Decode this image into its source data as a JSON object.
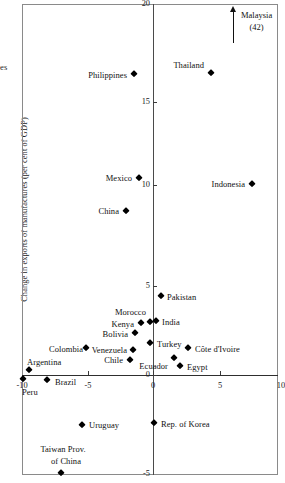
{
  "figure": {
    "ylabel": "Change in exports of manufactures (per cent of GDP)",
    "ytop_fragment": "es",
    "annotation": {
      "name": "Malaysia",
      "value": "(42)"
    }
  },
  "chart_data": {
    "type": "scatter",
    "title": "",
    "xlabel": "",
    "ylabel": "Change in exports of manufactures (per cent of GDP)",
    "xlim": [
      -10,
      10
    ],
    "ylim": [
      -5,
      20
    ],
    "xticks": [
      -10,
      -5,
      0,
      5,
      10
    ],
    "xtick_labels": [
      "-10",
      "-5",
      "0",
      "5",
      "10"
    ],
    "yticks": [
      -5,
      0,
      5,
      10,
      15,
      20
    ],
    "ytick_labels": [
      "-5",
      "0",
      "5",
      "10",
      "15",
      "20"
    ],
    "grid": false,
    "legend": "none",
    "marker": "diamond",
    "marker_color": "#000000",
    "annotations": [
      {
        "text": "Malaysia",
        "sub": "(42)",
        "x": 6.1,
        "y": 20.5,
        "note": "off-scale, arrow pointing up"
      }
    ],
    "points": [
      {
        "name": "Thailand",
        "x": 2.2,
        "y": 16.6,
        "label_pos": "left"
      },
      {
        "name": "Philippines",
        "x": -0.3,
        "y": 15.6,
        "label_pos": "left"
      },
      {
        "name": "Indonesia",
        "x": 7.4,
        "y": 10.5,
        "label_pos": "left"
      },
      {
        "name": "Mexico",
        "x": -1.1,
        "y": 10.8,
        "label_pos": "left"
      },
      {
        "name": "China",
        "x": -1.0,
        "y": 8.9,
        "label_pos": "left"
      },
      {
        "name": "Pakistan",
        "x": 0.4,
        "y": 4.6,
        "label_pos": "right"
      },
      {
        "name": "Morocco",
        "x": -0.2,
        "y": 3.1,
        "label_pos": "above-left"
      },
      {
        "name": "India",
        "x": 0.1,
        "y": 3.1,
        "label_pos": "right"
      },
      {
        "name": "Kenya",
        "x": -0.7,
        "y": 3.0,
        "label_pos": "left"
      },
      {
        "name": "Bolivia",
        "x": -1.2,
        "y": 2.4,
        "label_pos": "left"
      },
      {
        "name": "Turkey",
        "x": 0.1,
        "y": 1.9,
        "label_pos": "right"
      },
      {
        "name": "Colombia",
        "x": -3.0,
        "y": 1.4,
        "label_pos": "left"
      },
      {
        "name": "Venezuela",
        "x": -1.5,
        "y": 1.3,
        "label_pos": "left"
      },
      {
        "name": "Côte d'Ivoire",
        "x": 2.6,
        "y": 1.4,
        "label_pos": "right"
      },
      {
        "name": "Ecuador",
        "x": 1.6,
        "y": 0.8,
        "label_pos": "below-left"
      },
      {
        "name": "Chile",
        "x": -1.7,
        "y": 0.5,
        "label_pos": "left"
      },
      {
        "name": "Argentina",
        "x": -9.5,
        "y": 0.3,
        "label_pos": "above"
      },
      {
        "name": "Egypt",
        "x": 2.0,
        "y": 0.2,
        "label_pos": "right"
      },
      {
        "name": "Peru",
        "x": -9.9,
        "y": -0.2,
        "label_pos": "below"
      },
      {
        "name": "Brazil",
        "x": -8.0,
        "y": -0.3,
        "label_pos": "right"
      },
      {
        "name": "Rep. of Korea",
        "x": 0.0,
        "y": -2.6,
        "label_pos": "right"
      },
      {
        "name": "Uruguay",
        "x": -5.4,
        "y": -2.7,
        "label_pos": "right"
      },
      {
        "name": "Taiwan Prov. of China",
        "x": -7.0,
        "y": -5.4,
        "label_pos": "above"
      }
    ]
  },
  "markers": [
    {
      "name": "Thailand",
      "px": 211,
      "py": 73
    },
    {
      "name": "Philippines",
      "px": 134,
      "py": 74
    },
    {
      "name": "Indonesia",
      "px": 252,
      "py": 184
    },
    {
      "name": "Mexico",
      "px": 139,
      "py": 178
    },
    {
      "name": "China",
      "px": 126,
      "py": 211
    },
    {
      "name": "Pakistan",
      "px": 161,
      "py": 296
    },
    {
      "name": "Morocco",
      "px": 150,
      "py": 322
    },
    {
      "name": "India",
      "px": 156,
      "py": 321
    },
    {
      "name": "Kenya",
      "px": 141,
      "py": 323
    },
    {
      "name": "Bolivia",
      "px": 135,
      "py": 333
    },
    {
      "name": "Turkey",
      "px": 150,
      "py": 343
    },
    {
      "name": "Colombia",
      "px": 86,
      "py": 348
    },
    {
      "name": "Venezuela",
      "px": 133,
      "py": 350
    },
    {
      "name": "Cote d'Ivoire",
      "px": 188,
      "py": 348
    },
    {
      "name": "Ecuador",
      "px": 174,
      "py": 358
    },
    {
      "name": "Chile",
      "px": 130,
      "py": 360
    },
    {
      "name": "Argentina",
      "px": 29,
      "py": 370
    },
    {
      "name": "Egypt",
      "px": 180,
      "py": 366
    },
    {
      "name": "Peru",
      "px": 23,
      "py": 379
    },
    {
      "name": "Brazil",
      "px": 47,
      "py": 380
    },
    {
      "name": "Rep. of Korea",
      "px": 154,
      "py": 423
    },
    {
      "name": "Uruguay",
      "px": 82,
      "py": 425
    },
    {
      "name": "Taiwan Prov. of China",
      "px": 61,
      "py": 473
    }
  ],
  "labels": [
    {
      "text": "Thailand",
      "px": 204,
      "py": 65,
      "anchor": "r"
    },
    {
      "text": "Philippines",
      "px": 127,
      "py": 75,
      "anchor": "r"
    },
    {
      "text": "Indonesia",
      "px": 245,
      "py": 184,
      "anchor": "r"
    },
    {
      "text": "Mexico",
      "px": 132,
      "py": 178,
      "anchor": "r"
    },
    {
      "text": "China",
      "px": 119,
      "py": 211,
      "anchor": "r"
    },
    {
      "text": "Pakistan",
      "px": 167,
      "py": 297,
      "anchor": "l"
    },
    {
      "text": "Morocco",
      "px": 146,
      "py": 312,
      "anchor": "r"
    },
    {
      "text": "India",
      "px": 162,
      "py": 322,
      "anchor": "l"
    },
    {
      "text": "Kenya",
      "px": 134,
      "py": 324,
      "anchor": "r"
    },
    {
      "text": "Bolivia",
      "px": 128,
      "py": 334,
      "anchor": "r"
    },
    {
      "text": "Turkey",
      "px": 157,
      "py": 344,
      "anchor": "l"
    },
    {
      "text": "Colombia",
      "px": 83,
      "py": 349,
      "anchor": "r"
    },
    {
      "text": "Venezuela",
      "px": 127,
      "py": 350,
      "anchor": "r"
    },
    {
      "text": "Côte d'Ivoire",
      "px": 195,
      "py": 349,
      "anchor": "l"
    },
    {
      "text": "Ecuador",
      "px": 168,
      "py": 366,
      "anchor": "r"
    },
    {
      "text": "Chile",
      "px": 123,
      "py": 360,
      "anchor": "r"
    },
    {
      "text": "Argentina",
      "px": 27,
      "py": 362,
      "anchor": "l"
    },
    {
      "text": "Egypt",
      "px": 187,
      "py": 367,
      "anchor": "l"
    },
    {
      "text": "Peru",
      "px": 22,
      "py": 392,
      "anchor": "l"
    },
    {
      "text": "Brazil",
      "px": 55,
      "py": 382,
      "anchor": "l"
    },
    {
      "text": "Rep. of Korea",
      "px": 161,
      "py": 424,
      "anchor": "l"
    },
    {
      "text": "Uruguay",
      "px": 89,
      "py": 425,
      "anchor": "l"
    },
    {
      "text": "Taiwan Prov.",
      "px": 63,
      "py": 449,
      "anchor": "c"
    },
    {
      "text": "of China",
      "px": 66,
      "py": 461,
      "anchor": "c"
    }
  ],
  "xtick_render": [
    {
      "label": "-10",
      "px": 22
    },
    {
      "label": "-5",
      "px": 88
    },
    {
      "label": "0",
      "px": 153
    },
    {
      "label": "5",
      "px": 220
    },
    {
      "label": "10",
      "px": 281
    }
  ],
  "ytick_render": [
    {
      "label": "20",
      "py": 4
    },
    {
      "label": "15",
      "py": 102
    },
    {
      "label": "10",
      "py": 185
    },
    {
      "label": "5",
      "py": 286
    },
    {
      "label": "0",
      "py": 375
    },
    {
      "label": "-5",
      "py": 474
    }
  ]
}
